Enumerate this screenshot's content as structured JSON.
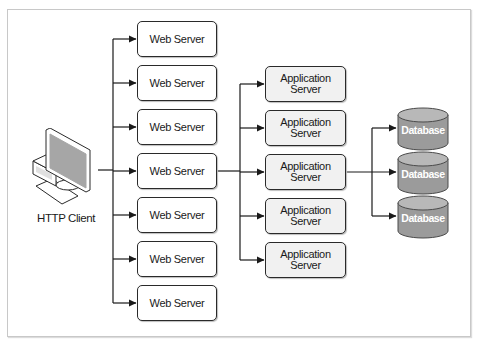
{
  "diagram": {
    "client": {
      "label": "HTTP Client",
      "icon": "desktop-computer-icon"
    },
    "web_servers": [
      {
        "label": "Web Server"
      },
      {
        "label": "Web Server"
      },
      {
        "label": "Web Server"
      },
      {
        "label": "Web Server"
      },
      {
        "label": "Web Server"
      },
      {
        "label": "Web Server"
      },
      {
        "label": "Web Server"
      }
    ],
    "app_servers": [
      {
        "line1": "Application",
        "line2": "Server"
      },
      {
        "line1": "Application",
        "line2": "Server"
      },
      {
        "line1": "Application",
        "line2": "Server"
      },
      {
        "line1": "Application",
        "line2": "Server"
      },
      {
        "line1": "Application",
        "line2": "Server"
      }
    ],
    "databases": [
      {
        "label": "Database",
        "icon": "database-cylinder-icon"
      },
      {
        "label": "Database",
        "icon": "database-cylinder-icon"
      },
      {
        "label": "Database",
        "icon": "database-cylinder-icon"
      }
    ],
    "connections": [
      {
        "from": "HTTP Client",
        "to": "Web Server (all 7)"
      },
      {
        "from": "Web Server (middle)",
        "to": "Application Server (all 5)"
      },
      {
        "from": "Application Server (middle)",
        "to": "Database (all 3)"
      }
    ],
    "colors": {
      "line": "#1a1a1a",
      "web_fill": "#ffffff",
      "app_fill": "#f1f1f1",
      "db_body": "#9b9b9b",
      "db_top": "#b8b8b8",
      "frame": "#c8c8c8"
    }
  }
}
